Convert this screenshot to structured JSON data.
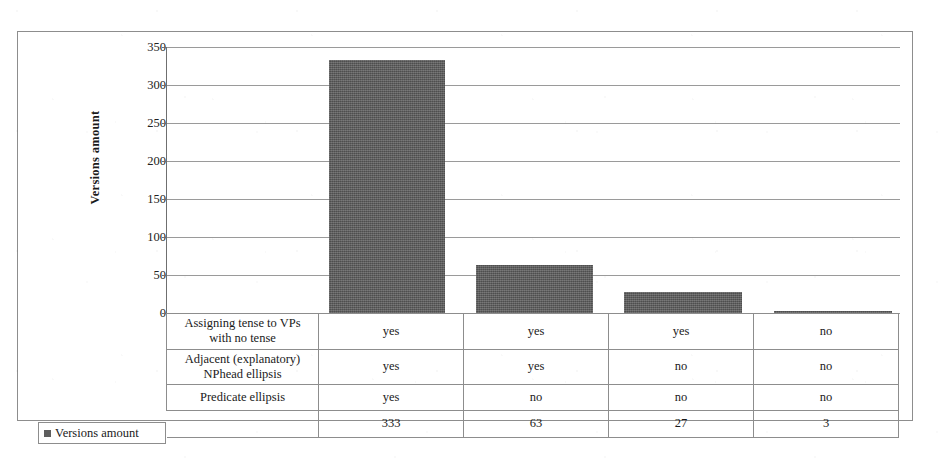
{
  "chart_data": {
    "type": "bar",
    "title": "",
    "xlabel": "",
    "ylabel": "Versions amount",
    "ylim": [
      0,
      350
    ],
    "ytick_step": 50,
    "yticks": [
      "350",
      "300",
      "250",
      "200",
      "150",
      "100",
      "50",
      "0"
    ],
    "grid": true,
    "legend_position": "bottom-left",
    "legend_entries": [
      "Versions amount"
    ],
    "categories": [
      "1",
      "2",
      "3",
      "4"
    ],
    "values": [
      333,
      63,
      27,
      3
    ],
    "bar_color": "#5e5e5e"
  },
  "table": {
    "row_labels": [
      "Assigning tense to VPs with no tense",
      "Adjacent (explanatory) NPhead ellipsis",
      "Predicate ellipsis"
    ],
    "rows": [
      {
        "label": "Assigning tense to VPs",
        "label2": "with no tense",
        "cells": [
          "yes",
          "yes",
          "yes",
          "no"
        ]
      },
      {
        "label": "Adjacent (explanatory)",
        "label2": "NPhead ellipsis",
        "cells": [
          "yes",
          "yes",
          "no",
          "no"
        ]
      },
      {
        "label": "Predicate ellipsis",
        "label2": "",
        "cells": [
          "yes",
          "no",
          "no",
          "no"
        ]
      }
    ],
    "total_row": {
      "label": "Versions amount",
      "cells": [
        "333",
        "63",
        "27",
        "3"
      ]
    }
  },
  "legend": {
    "label": "Versions amount",
    "swatch_color": "#5e5e5e"
  },
  "axis": {
    "y_title": "Versions amount",
    "ticks": [
      "350",
      "300",
      "250",
      "200",
      "150",
      "100",
      "50",
      "0"
    ]
  }
}
